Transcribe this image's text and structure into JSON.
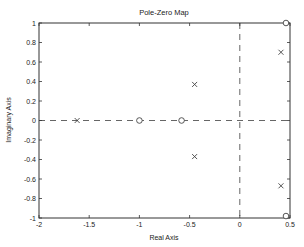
{
  "chart_data": {
    "type": "scatter",
    "title": "Pole-Zero Map",
    "xlabel": "Real Axis",
    "ylabel": "Imaginary Axis",
    "xlim": [
      -2,
      0.5
    ],
    "ylim": [
      -1,
      1
    ],
    "xticks": [
      -2,
      -1.5,
      -1,
      -0.5,
      0,
      0.5
    ],
    "xtick_labels": [
      "-2",
      "-1.5",
      "-1",
      "-0.5",
      "0",
      "0.5"
    ],
    "yticks": [
      -1,
      -0.8,
      -0.6,
      -0.4,
      -0.2,
      0,
      0.2,
      0.4,
      0.6,
      0.8,
      1
    ],
    "ytick_labels": [
      "-1",
      "-0.8",
      "-0.6",
      "-0.4",
      "-0.2",
      "0",
      "0.2",
      "0.4",
      "0.6",
      "0.8",
      "1"
    ],
    "grid": false,
    "reference_lines": {
      "real_axis_zero": "dashed",
      "imag_axis_zero": "dashed"
    },
    "series": [
      {
        "name": "poles",
        "marker": "x",
        "points": [
          {
            "re": -1.62,
            "im": 0
          },
          {
            "re": -0.45,
            "im": 0.37
          },
          {
            "re": -0.45,
            "im": -0.37
          },
          {
            "re": 0.41,
            "im": 0.7
          },
          {
            "re": 0.41,
            "im": -0.67
          }
        ]
      },
      {
        "name": "zeros",
        "marker": "o",
        "points": [
          {
            "re": -1.0,
            "im": 0
          },
          {
            "re": -0.58,
            "im": 0
          },
          {
            "re": 0.46,
            "im": 1.0
          },
          {
            "re": 0.46,
            "im": -0.98
          }
        ]
      }
    ],
    "colors": {
      "axis": "#333333",
      "marker": "#444444",
      "dash": "#555555"
    }
  }
}
